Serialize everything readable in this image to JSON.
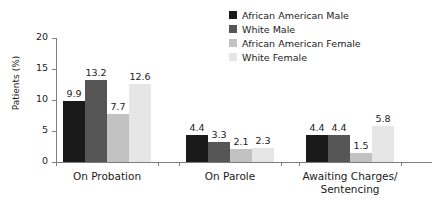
{
  "chart_data": {
    "type": "bar",
    "title": "",
    "xlabel": "",
    "ylabel": "Patients (%)",
    "ylim": [
      0,
      20
    ],
    "yticks": [
      "0",
      "5",
      "10",
      "15",
      "20"
    ],
    "grid": false,
    "legend_position": "top-right",
    "categories": [
      "On Probation",
      "On Parole",
      "Awaiting Charges/\nSentencing"
    ],
    "series": [
      {
        "name": "African American Male",
        "color": "#1a1a1a",
        "values": [
          9.9,
          4.4,
          4.4
        ],
        "labels": [
          "9.9",
          "4.4",
          "4.4"
        ]
      },
      {
        "name": "White Male",
        "color": "#565656",
        "values": [
          13.2,
          3.3,
          4.4
        ],
        "labels": [
          "13.2",
          "3.3",
          "4.4"
        ]
      },
      {
        "name": "African American Female",
        "color": "#c2c2c2",
        "values": [
          7.7,
          2.1,
          1.5
        ],
        "labels": [
          "7.7",
          "2.1",
          "1.5"
        ]
      },
      {
        "name": "White Female",
        "color": "#e6e6e6",
        "values": [
          12.6,
          2.3,
          5.8
        ],
        "labels": [
          "12.6",
          "2.3",
          "5.8"
        ]
      }
    ]
  }
}
